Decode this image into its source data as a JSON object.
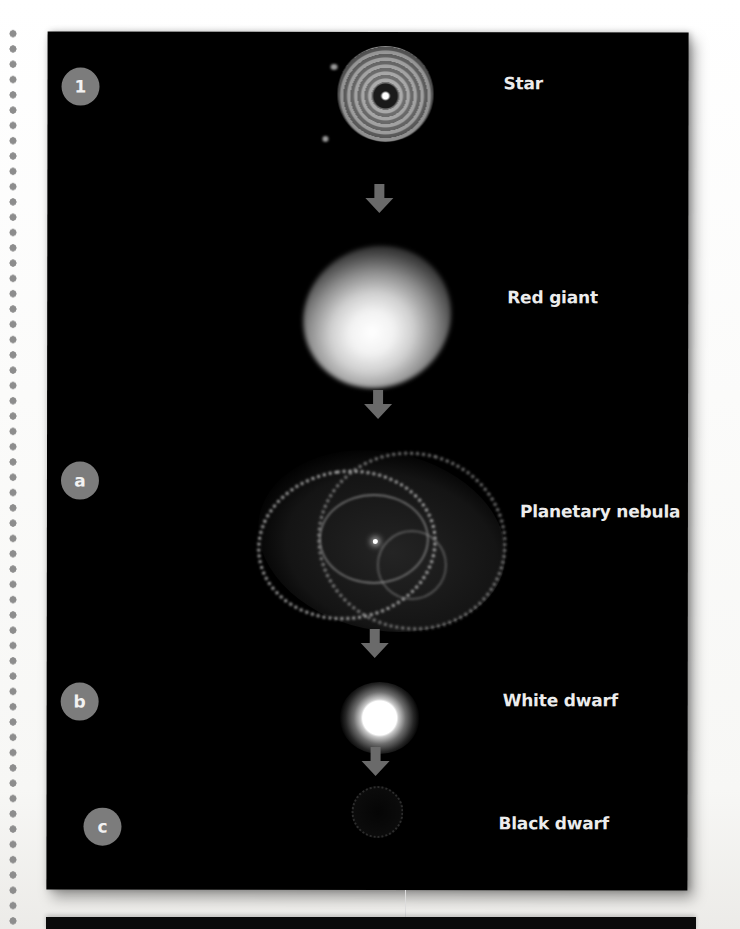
{
  "figure": {
    "background_color": "#000000",
    "badge_color": "#7c7c7c",
    "label_color": "#ececec",
    "arrow_color": "#6a6a6a"
  },
  "stages": [
    {
      "badge": "1",
      "label": "Star",
      "object": "star-image"
    },
    {
      "badge": "",
      "label": "Red giant",
      "object": "red-giant-image"
    },
    {
      "badge": "a",
      "label": "Planetary nebula",
      "object": "planetary-nebula-image"
    },
    {
      "badge": "b",
      "label": "White dwarf",
      "object": "white-dwarf-image"
    },
    {
      "badge": "c",
      "label": "Black dwarf",
      "object": "black-dwarf-image"
    }
  ],
  "arrows": [
    {
      "from": "Star",
      "to": "Red giant",
      "icon": "arrow-down-icon"
    },
    {
      "from": "Red giant",
      "to": "Planetary nebula",
      "icon": "arrow-down-icon"
    },
    {
      "from": "Planetary nebula",
      "to": "White dwarf",
      "icon": "arrow-down-icon"
    },
    {
      "from": "White dwarf",
      "to": "Black dwarf",
      "icon": "arrow-down-icon"
    }
  ],
  "decorations": {
    "margin": "dotted-binding-margin"
  }
}
